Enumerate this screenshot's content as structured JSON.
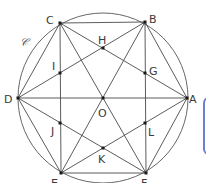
{
  "figure": {
    "type": "regular hexagon inscribed in circle with star diagonals",
    "circle": {
      "label": "𝒞",
      "center": "O",
      "cx": 103,
      "cy": 98,
      "r": 85
    },
    "points": {
      "A": {
        "label": "A",
        "x": 187,
        "y": 98
      },
      "B": {
        "label": "B",
        "x": 145,
        "y": 22
      },
      "C": {
        "label": "C",
        "x": 60,
        "y": 23
      },
      "D": {
        "label": "D",
        "x": 18,
        "y": 98
      },
      "E": {
        "label": "E",
        "x": 61,
        "y": 173
      },
      "F": {
        "label": "F",
        "x": 146,
        "y": 173
      },
      "O": {
        "label": "O",
        "x": 103,
        "y": 98
      },
      "G": {
        "label": "G",
        "x": 145,
        "y": 73
      },
      "H": {
        "label": "H",
        "x": 103,
        "y": 48
      },
      "I": {
        "label": "I",
        "x": 60,
        "y": 73
      },
      "J": {
        "label": "J",
        "x": 60,
        "y": 123
      },
      "K": {
        "label": "K",
        "x": 103,
        "y": 148
      },
      "L": {
        "label": "L",
        "x": 145,
        "y": 123
      }
    },
    "segments": [
      [
        "A",
        "B"
      ],
      [
        "B",
        "C"
      ],
      [
        "C",
        "D"
      ],
      [
        "D",
        "E"
      ],
      [
        "E",
        "F"
      ],
      [
        "F",
        "A"
      ],
      [
        "D",
        "A"
      ],
      [
        "C",
        "E"
      ],
      [
        "B",
        "F"
      ],
      [
        "A",
        "C"
      ],
      [
        "C",
        "E"
      ],
      [
        "E",
        "A"
      ],
      [
        "B",
        "D"
      ],
      [
        "D",
        "F"
      ],
      [
        "F",
        "B"
      ],
      [
        "B",
        "E"
      ],
      [
        "C",
        "F"
      ]
    ]
  },
  "side_tab": {
    "color": "#6b7fd6"
  }
}
